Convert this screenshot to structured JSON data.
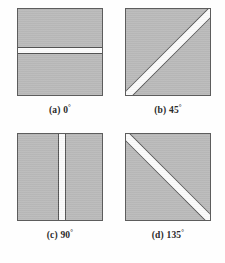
{
  "figure": {
    "colors": {
      "background": "#fefefe",
      "tile_fill": "#bababa",
      "tile_border": "#5d5d5d",
      "stripe_fill": "#fbfbfb",
      "stripe_edge": "#555555",
      "caption_text": "#2a2a2a"
    },
    "panels": [
      {
        "id": "a",
        "tag": "(a)",
        "angle_value": "0",
        "degree_symbol": "°",
        "angle_label": "0°",
        "caption": "(a) 0°",
        "stripe_orientation": "horizontal"
      },
      {
        "id": "b",
        "tag": "(b)",
        "angle_value": "45",
        "degree_symbol": "°",
        "angle_label": "45°",
        "caption": "(b) 45°",
        "stripe_orientation": "diagonal-up"
      },
      {
        "id": "c",
        "tag": "(c)",
        "angle_value": "90",
        "degree_symbol": "°",
        "angle_label": "90°",
        "caption": "(c) 90°",
        "stripe_orientation": "vertical"
      },
      {
        "id": "d",
        "tag": "(d)",
        "angle_value": "135",
        "degree_symbol": "°",
        "angle_label": "135°",
        "caption": "(d) 135°",
        "stripe_orientation": "diagonal-down"
      }
    ]
  }
}
